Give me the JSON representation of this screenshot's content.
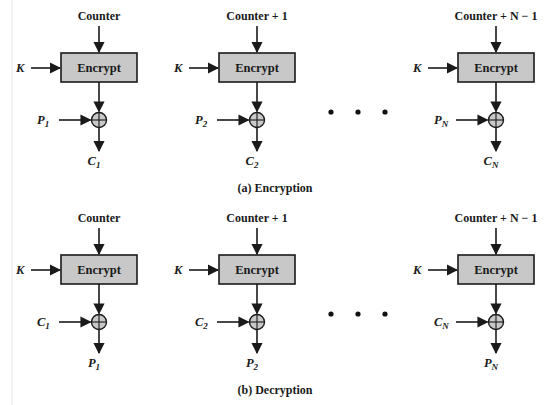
{
  "figure": {
    "colors": {
      "box_fill": "#c8c8c8",
      "stroke": "#1a1a1a",
      "background": "#ffffff"
    },
    "encryption": {
      "caption": "(a) Encryption",
      "stages": [
        {
          "counter": "Counter",
          "key": "K",
          "box": "Encrypt",
          "input_sym": "P",
          "input_sub": "1",
          "output_sym": "C",
          "output_sub": "1"
        },
        {
          "counter": "Counter + 1",
          "key": "K",
          "box": "Encrypt",
          "input_sym": "P",
          "input_sub": "2",
          "output_sym": "C",
          "output_sub": "2"
        },
        {
          "counter": "Counter + N − 1",
          "key": "K",
          "box": "Encrypt",
          "input_sym": "P",
          "input_sub": "N",
          "output_sym": "C",
          "output_sub": "N"
        }
      ],
      "ellipsis": "• • •"
    },
    "decryption": {
      "caption": "(b) Decryption",
      "stages": [
        {
          "counter": "Counter",
          "key": "K",
          "box": "Encrypt",
          "input_sym": "C",
          "input_sub": "1",
          "output_sym": "P",
          "output_sub": "1"
        },
        {
          "counter": "Counter + 1",
          "key": "K",
          "box": "Encrypt",
          "input_sym": "C",
          "input_sub": "2",
          "output_sym": "P",
          "output_sub": "2"
        },
        {
          "counter": "Counter + N − 1",
          "key": "K",
          "box": "Encrypt",
          "input_sym": "C",
          "input_sub": "N",
          "output_sym": "P",
          "output_sub": "N"
        }
      ],
      "ellipsis": "• • •"
    }
  }
}
